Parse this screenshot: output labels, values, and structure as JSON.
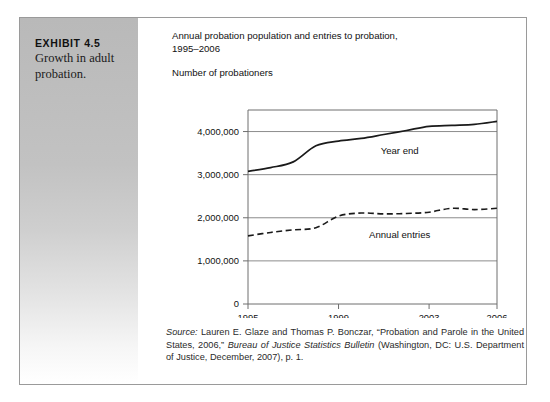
{
  "exhibit": {
    "number_label": "EXHIBIT 4.5",
    "caption": "Growth in adult probation."
  },
  "chart_title_line1": "Annual probation population and entries to probation,",
  "chart_title_line2": "1995–2006",
  "axis_caption": "Number of probationers",
  "source": {
    "prefix": "Source:",
    "text_part1": " Lauren E. Glaze and Thomas P. Bonczar, “Probation and Parole in the United States, 2006,” ",
    "italic_title": "Bureau of Justice Statistics Bulletin",
    "text_part2": " (Washington, DC: U.S. Department of Justice, December, 2007), p. 1."
  },
  "chart_data": {
    "type": "line",
    "title": "Annual probation population and entries to probation, 1995–2006",
    "xlabel": "",
    "ylabel": "Number of probationers",
    "xlim": [
      1995,
      2006
    ],
    "ylim": [
      0,
      4500000
    ],
    "grid": true,
    "gridlines_y": [
      1000000,
      2000000,
      3000000,
      4000000
    ],
    "ytick_labels": [
      "0",
      "1,000,000",
      "2,000,000",
      "3,000,000",
      "4,000,000"
    ],
    "ytick_values": [
      0,
      1000000,
      2000000,
      3000000,
      4000000
    ],
    "xtick_labels": [
      "1995",
      "1999",
      "2003",
      "2006"
    ],
    "xtick_values": [
      1995,
      1999,
      2003,
      2006
    ],
    "legend_position": "inline-annotations",
    "series": [
      {
        "name": "Year end",
        "style": "solid",
        "color": "#1a1a1a",
        "x": [
          1995,
          1996,
          1997,
          1998,
          1999,
          2000,
          2001,
          2002,
          2003,
          2004,
          2005,
          2006
        ],
        "values": [
          3078000,
          3165000,
          3297000,
          3670000,
          3779000,
          3840000,
          3932000,
          4025000,
          4120000,
          4144000,
          4166000,
          4237000
        ]
      },
      {
        "name": "Annual entries",
        "style": "dashed",
        "color": "#1a1a1a",
        "x": [
          1995,
          1996,
          1997,
          1998,
          1999,
          2000,
          2001,
          2002,
          2003,
          2004,
          2005,
          2006
        ],
        "values": [
          1580000,
          1660000,
          1720000,
          1770000,
          2040000,
          2110000,
          2090000,
          2100000,
          2130000,
          2220000,
          2190000,
          2220000
        ]
      }
    ]
  }
}
